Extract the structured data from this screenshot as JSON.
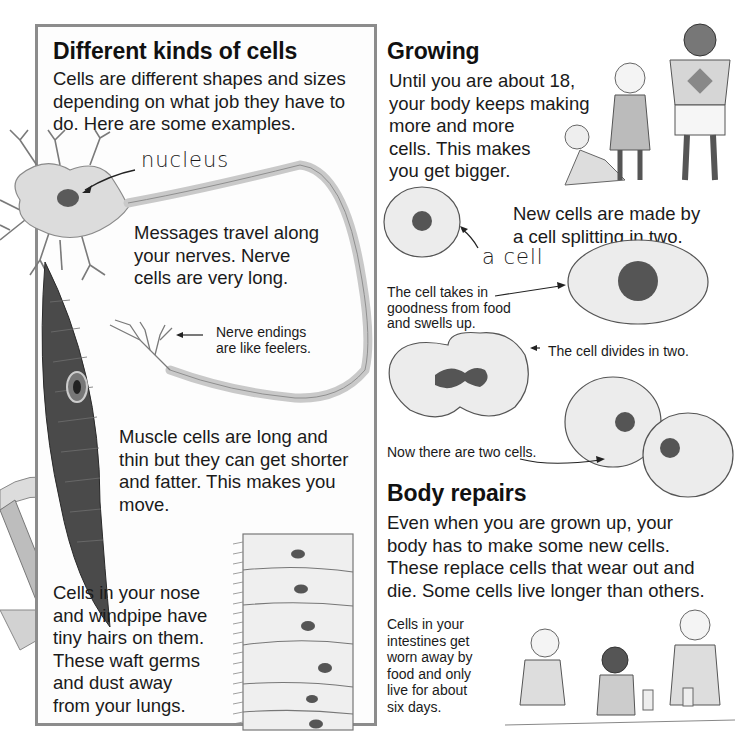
{
  "left_panel": {
    "title": "Different kinds of cells",
    "intro": "Cells are different shapes and sizes\ndepending on what job they have to\ndo. Here are some examples.",
    "nucleus_label": "nucleus",
    "nerve_text": "Messages travel along\nyour nerves. Nerve\ncells are very long.",
    "nerve_endings_caption": "Nerve endings\nare like feelers.",
    "muscle_text": "Muscle cells are long and\nthin but they can get shorter\nand fatter. This makes you\nmove.",
    "nose_text": "Cells in your nose\nand windpipe have\ntiny hairs on them.\nThese waft germs\nand dust away\nfrom your lungs."
  },
  "growing": {
    "title": "Growing",
    "text": "Until you are about 18,\nyour body keeps making\nmore and more\ncells. This makes\nyou get bigger.",
    "new_cells_text": "New cells are made by\na cell splitting in two.",
    "cell_label": "a cell",
    "step_swell": "The cell takes in\ngoodness from food\nand swells up.",
    "step_divide": "The cell divides in two.",
    "step_two": "Now there are two cells."
  },
  "body_repairs": {
    "title": "Body repairs",
    "text": "Even when you are grown up, your\nbody has to make some new cells.\nThese replace cells that wear out and\ndie. Some cells live longer than others.",
    "intestine_text": "Cells in your\nintestines get\nworn away by\nfood and only\nlive for about\nsix days."
  },
  "colors": {
    "panel_border": "#8c8c8c",
    "cell_fill": "#ececec",
    "nucleus": "#555555",
    "text": "#1a1a1a"
  }
}
